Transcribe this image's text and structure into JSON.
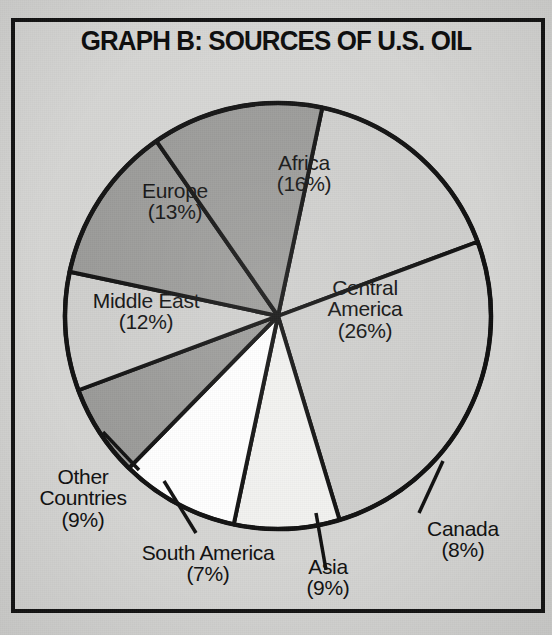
{
  "title": "GRAPH B: SOURCES OF U.S. OIL",
  "colors": {
    "paper": "#d4d4d2",
    "frame_border": "#141414",
    "slice_light": "#ffffff",
    "slice_offwhite": "#f2f2f0",
    "slice_lightgray": "#cfcfcd",
    "slice_medgray": "#bcbcba",
    "slice_darkgray": "#9a9a98",
    "outline": "#101010",
    "text": "#101010"
  },
  "chart_data": {
    "type": "pie",
    "title": "GRAPH B: SOURCES OF U.S. OIL",
    "unit": "percent",
    "total": 100,
    "categories": [
      "Africa",
      "Central America",
      "Canada",
      "Asia",
      "South America",
      "Other Countries",
      "Middle East",
      "Europe"
    ],
    "values": [
      16,
      26,
      8,
      9,
      7,
      9,
      12,
      13
    ],
    "labels": [
      "Africa (16%)",
      "Central America (26%)",
      "Canada (8%)",
      "Asia (9%)",
      "South America (7%)",
      "Other Countries (9%)",
      "Middle East (12%)",
      "Europe (13%)"
    ],
    "legend": "none",
    "grid": false,
    "start_angle_deg": 12,
    "direction": "clockwise",
    "slices": [
      {
        "name": "Africa",
        "value": 16,
        "pct_text": "(16%)",
        "fill": "#cfcfcd",
        "label_inside": true
      },
      {
        "name": "Central America",
        "value": 26,
        "pct_text": "(26%)",
        "fill": "#cfcfcd",
        "label_inside": true
      },
      {
        "name": "Canada",
        "value": 8,
        "pct_text": "(8%)",
        "fill": "#f2f2f0",
        "label_inside": false
      },
      {
        "name": "Asia",
        "value": 9,
        "pct_text": "(9%)",
        "fill": "#ffffff",
        "label_inside": false
      },
      {
        "name": "South America",
        "value": 7,
        "pct_text": "(7%)",
        "fill": "#9a9a98",
        "label_inside": false
      },
      {
        "name": "Other Countries",
        "value": 9,
        "pct_text": "(9%)",
        "fill": "#cfcfcd",
        "label_inside": false
      },
      {
        "name": "Middle East",
        "value": 12,
        "pct_text": "(12%)",
        "fill": "#9a9a98",
        "label_inside": true
      },
      {
        "name": "Europe",
        "value": 13,
        "pct_text": "(13%)",
        "fill": "#9a9a98",
        "label_inside": true
      }
    ]
  },
  "labels": {
    "africa_name": "Africa",
    "africa_pct": "(16%)",
    "central_america_name_1": "Central",
    "central_america_name_2": "America",
    "central_america_pct": "(26%)",
    "canada_name": "Canada",
    "canada_pct": "(8%)",
    "asia_name": "Asia",
    "asia_pct": "(9%)",
    "south_america_name": "South America",
    "south_america_pct": "(7%)",
    "other_name_1": "Other",
    "other_name_2": "Countries",
    "other_pct": "(9%)",
    "middle_east_name": "Middle East",
    "middle_east_pct": "(12%)",
    "europe_name": "Europe",
    "europe_pct": "(13%)"
  }
}
